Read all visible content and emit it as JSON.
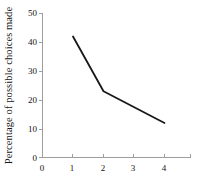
{
  "chart_data": {
    "type": "line",
    "title": "",
    "xlabel": "",
    "ylabel": "Percentage of possible choices made",
    "x": [
      1,
      2,
      4
    ],
    "values": [
      42,
      23,
      12
    ],
    "series": [
      {
        "name": "percentage of possible choices made",
        "values": [
          42,
          23,
          12
        ]
      }
    ],
    "xlim": [
      0,
      4.9
    ],
    "ylim": [
      0,
      50
    ],
    "xticks": [
      0,
      1,
      2,
      3,
      4
    ],
    "xtick_labels": [
      "0",
      "1",
      "2",
      "3",
      "4"
    ],
    "yticks": [
      0,
      10,
      20,
      30,
      40,
      50
    ],
    "ytick_labels": [
      "0",
      "10",
      "20",
      "30",
      "40",
      "50"
    ],
    "grid": false,
    "legend": "none",
    "line_color": "#181818",
    "axis_color": "#9a9a9a"
  }
}
